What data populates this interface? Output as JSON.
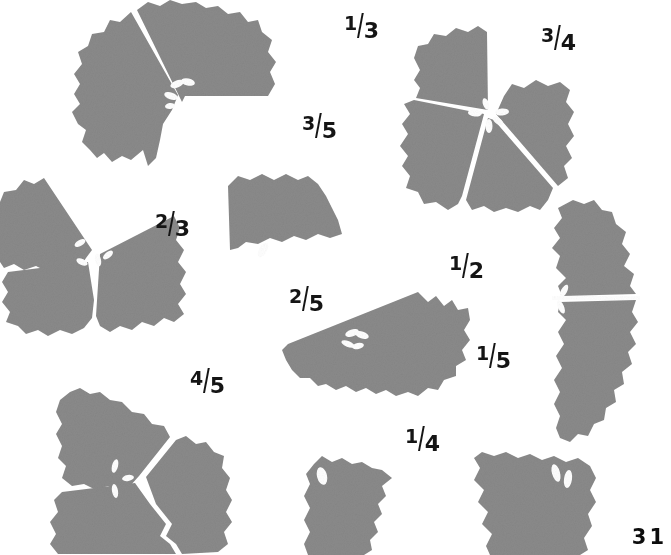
{
  "page": {
    "page_number": "31",
    "background_color": "#ffffff",
    "cookie_color": "#8a8a8a",
    "cut_color": "#ffffff",
    "text_color": "#151515"
  },
  "labels": [
    {
      "id": "label-1-3",
      "text": "1/3",
      "numerator": "1",
      "denominator": "3",
      "x": 344,
      "y": 10
    },
    {
      "id": "label-3-4",
      "text": "3/4",
      "numerator": "3",
      "denominator": "4",
      "x": 541,
      "y": 22
    },
    {
      "id": "label-3-5",
      "text": "3/5",
      "numerator": "3",
      "denominator": "5",
      "x": 302,
      "y": 110
    },
    {
      "id": "label-2-3",
      "text": "2/3",
      "numerator": "2",
      "denominator": "3",
      "x": 155,
      "y": 208
    },
    {
      "id": "label-1-2",
      "text": "1/2",
      "numerator": "1",
      "denominator": "2",
      "x": 449,
      "y": 250
    },
    {
      "id": "label-2-5",
      "text": "2/5",
      "numerator": "2",
      "denominator": "5",
      "x": 289,
      "y": 283
    },
    {
      "id": "label-1-5",
      "text": "1/5",
      "numerator": "1",
      "denominator": "5",
      "x": 476,
      "y": 340
    },
    {
      "id": "label-4-5",
      "text": "4/5",
      "numerator": "4",
      "denominator": "5",
      "x": 190,
      "y": 365
    },
    {
      "id": "label-1-4",
      "text": "1/4",
      "numerator": "1",
      "denominator": "4",
      "x": 405,
      "y": 423
    }
  ],
  "shapes": [
    {
      "id": "cookie-top-left",
      "name": "cookie-two-thirds",
      "pieces": 2,
      "description": "cookie with one wedge missing"
    },
    {
      "id": "cookie-top-right",
      "name": "cookie-four-fifths",
      "pieces": 4,
      "description": "cookie divided into wedges with one missing"
    },
    {
      "id": "cookie-mid-left",
      "name": "cookie-three-parts",
      "pieces": 3,
      "description": "cookie divided into three wedges"
    },
    {
      "id": "wedge-mid-center",
      "name": "cookie-single-wedge",
      "pieces": 1,
      "description": "single cookie wedge"
    },
    {
      "id": "cookie-mid-right",
      "name": "cookie-two-halves",
      "pieces": 2,
      "description": "cookie cut into two halves"
    },
    {
      "id": "half-center",
      "name": "cookie-half-wedge",
      "pieces": 1,
      "description": "half cookie piece"
    },
    {
      "id": "cookie-bottom-left",
      "name": "cookie-quarters",
      "pieces": 3,
      "description": "cookie divided into wedges"
    },
    {
      "id": "wedge-bottom-center",
      "name": "cookie-wedge-small",
      "pieces": 1,
      "description": "small cookie wedge"
    },
    {
      "id": "wedge-bottom-right",
      "name": "cookie-wedge-wide",
      "pieces": 1,
      "description": "wide cookie wedge"
    }
  ]
}
